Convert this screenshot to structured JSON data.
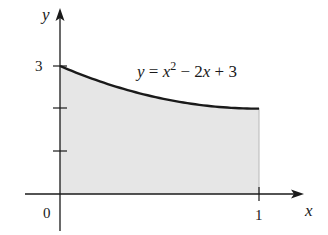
{
  "chart_data": {
    "type": "area",
    "title": "",
    "function_label": "y = x² − 2x + 3",
    "function_parts": {
      "lhs": "y",
      "eq": " = ",
      "x": "x",
      "exp": "2",
      "rest1": " − 2",
      "x2": "x",
      "rest2": " + 3"
    },
    "xlabel": "x",
    "ylabel": "y",
    "x": [
      0,
      0.1,
      0.2,
      0.3,
      0.4,
      0.5,
      0.6,
      0.7,
      0.8,
      0.9,
      1.0
    ],
    "values": [
      3,
      2.81,
      2.64,
      2.49,
      2.36,
      2.25,
      2.16,
      2.09,
      2.04,
      2.01,
      2
    ],
    "shaded_region": {
      "from_x": 0,
      "to_x": 1,
      "under": "y = x^2 - 2x + 3",
      "fill": "#e6e6e6"
    },
    "xlim": [
      0,
      1
    ],
    "ylim": [
      0,
      3
    ],
    "x_ticks": [
      {
        "value": 0,
        "label": "0"
      },
      {
        "value": 1,
        "label": "1"
      }
    ],
    "y_ticks": [
      {
        "value": 1,
        "label": ""
      },
      {
        "value": 2,
        "label": ""
      },
      {
        "value": 3,
        "label": "3"
      }
    ],
    "grid": false,
    "legend": null
  },
  "labels": {
    "y_axis": "y",
    "x_axis": "x",
    "origin": "0",
    "x_tick_1": "1",
    "y_tick_3": "3"
  },
  "colors": {
    "curve": "#1a1a1a",
    "fill": "#e6e6e6",
    "axis": "#1a1a1a"
  }
}
